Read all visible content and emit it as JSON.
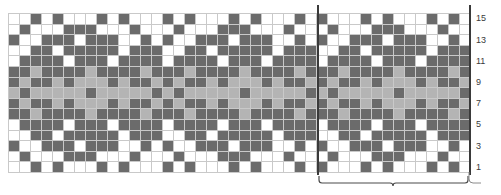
{
  "chart_data": {
    "type": "heatmap",
    "title": "",
    "xlabel": "",
    "ylabel": "",
    "rows": 15,
    "columns": 42,
    "palette": {
      "0": "#ffffff",
      "1": "#b4b4b4",
      "2": "#6b6b6b"
    },
    "color_names": {
      "0": "white",
      "1": "light-grey",
      "2": "dark-grey"
    },
    "row_numbers_visible": [
      15,
      13,
      11,
      9,
      7,
      5,
      3,
      1
    ],
    "row_number_side": "right",
    "repeat": {
      "label": "",
      "start_column": 29,
      "end_column": 42,
      "stitches": 14
    },
    "grid": [
      [
        0,
        0,
        2,
        0,
        2,
        0,
        0,
        0,
        2,
        0,
        2,
        0,
        0,
        0,
        2,
        0,
        2,
        0,
        0,
        0,
        2,
        0,
        2,
        0,
        0,
        0,
        2,
        0,
        2,
        0,
        0,
        0,
        2,
        0,
        2,
        0,
        0,
        0,
        2,
        0,
        2,
        0
      ],
      [
        0,
        2,
        0,
        0,
        0,
        2,
        2,
        2,
        0,
        0,
        0,
        2,
        0,
        0,
        0,
        2,
        0,
        0,
        0,
        2,
        2,
        2,
        0,
        0,
        0,
        2,
        0,
        0,
        0,
        2,
        0,
        0,
        0,
        2,
        2,
        2,
        0,
        0,
        0,
        2,
        0,
        0
      ],
      [
        2,
        0,
        0,
        2,
        2,
        2,
        0,
        2,
        2,
        2,
        0,
        0,
        2,
        0,
        2,
        0,
        0,
        2,
        2,
        2,
        0,
        2,
        2,
        2,
        0,
        0,
        2,
        0,
        2,
        0,
        0,
        2,
        2,
        2,
        0,
        2,
        2,
        2,
        0,
        0,
        2,
        0
      ],
      [
        0,
        0,
        2,
        2,
        0,
        2,
        2,
        2,
        2,
        2,
        0,
        2,
        2,
        2,
        0,
        0,
        2,
        2,
        0,
        2,
        2,
        2,
        2,
        2,
        0,
        2,
        2,
        2,
        0,
        0,
        2,
        2,
        0,
        2,
        2,
        2,
        2,
        2,
        0,
        2,
        2,
        2
      ],
      [
        0,
        2,
        2,
        2,
        2,
        0,
        2,
        2,
        2,
        0,
        2,
        2,
        2,
        2,
        0,
        2,
        2,
        2,
        2,
        0,
        2,
        2,
        2,
        0,
        2,
        2,
        2,
        2,
        0,
        2,
        2,
        2,
        2,
        0,
        2,
        2,
        2,
        0,
        2,
        2,
        2,
        2
      ],
      [
        2,
        2,
        1,
        2,
        2,
        2,
        2,
        1,
        2,
        2,
        2,
        2,
        1,
        2,
        2,
        2,
        1,
        2,
        2,
        2,
        2,
        1,
        2,
        2,
        2,
        2,
        1,
        2,
        2,
        2,
        1,
        2,
        2,
        2,
        2,
        1,
        2,
        2,
        2,
        2,
        1,
        2
      ],
      [
        2,
        1,
        2,
        2,
        1,
        2,
        1,
        1,
        1,
        2,
        1,
        2,
        2,
        1,
        2,
        1,
        2,
        2,
        1,
        2,
        1,
        1,
        1,
        2,
        1,
        2,
        2,
        1,
        2,
        1,
        2,
        2,
        1,
        2,
        1,
        1,
        1,
        2,
        1,
        2,
        2,
        1
      ],
      [
        1,
        2,
        1,
        1,
        1,
        1,
        1,
        2,
        1,
        1,
        1,
        1,
        1,
        2,
        1,
        2,
        1,
        1,
        1,
        1,
        1,
        2,
        1,
        1,
        1,
        1,
        1,
        2,
        1,
        2,
        1,
        1,
        1,
        1,
        1,
        2,
        1,
        1,
        1,
        1,
        1,
        2
      ],
      [
        2,
        1,
        2,
        2,
        1,
        2,
        1,
        1,
        1,
        2,
        1,
        2,
        2,
        1,
        2,
        1,
        2,
        2,
        1,
        2,
        1,
        1,
        1,
        2,
        1,
        2,
        2,
        1,
        2,
        1,
        2,
        2,
        1,
        2,
        1,
        1,
        1,
        2,
        1,
        2,
        2,
        1
      ],
      [
        2,
        2,
        1,
        2,
        2,
        2,
        2,
        1,
        2,
        2,
        2,
        2,
        1,
        2,
        2,
        2,
        1,
        2,
        2,
        2,
        2,
        1,
        2,
        2,
        2,
        2,
        1,
        2,
        2,
        2,
        1,
        2,
        2,
        2,
        2,
        1,
        2,
        2,
        2,
        2,
        1,
        2
      ],
      [
        0,
        2,
        2,
        2,
        2,
        0,
        2,
        2,
        2,
        0,
        2,
        2,
        2,
        2,
        0,
        2,
        2,
        2,
        2,
        0,
        2,
        2,
        2,
        0,
        2,
        2,
        2,
        2,
        0,
        2,
        2,
        2,
        2,
        0,
        2,
        2,
        2,
        0,
        2,
        2,
        2,
        2
      ],
      [
        0,
        0,
        2,
        2,
        0,
        2,
        2,
        2,
        2,
        2,
        0,
        2,
        2,
        2,
        0,
        0,
        2,
        2,
        0,
        2,
        2,
        2,
        2,
        2,
        0,
        2,
        2,
        2,
        0,
        0,
        2,
        2,
        0,
        2,
        2,
        2,
        2,
        2,
        0,
        2,
        2,
        2
      ],
      [
        2,
        0,
        0,
        2,
        2,
        2,
        0,
        2,
        2,
        2,
        0,
        0,
        2,
        0,
        2,
        0,
        0,
        2,
        2,
        2,
        0,
        2,
        2,
        2,
        0,
        0,
        2,
        0,
        2,
        0,
        0,
        2,
        2,
        2,
        0,
        2,
        2,
        2,
        0,
        0,
        2,
        0
      ],
      [
        0,
        2,
        0,
        0,
        0,
        2,
        2,
        2,
        0,
        0,
        0,
        2,
        0,
        0,
        0,
        2,
        0,
        0,
        0,
        2,
        2,
        2,
        0,
        0,
        0,
        2,
        0,
        0,
        0,
        2,
        0,
        0,
        0,
        2,
        2,
        2,
        0,
        0,
        0,
        2,
        0,
        0
      ],
      [
        0,
        0,
        2,
        0,
        2,
        0,
        0,
        0,
        2,
        0,
        2,
        0,
        0,
        0,
        2,
        0,
        2,
        0,
        0,
        0,
        2,
        0,
        2,
        0,
        0,
        0,
        2,
        0,
        2,
        0,
        0,
        0,
        2,
        0,
        2,
        0,
        0,
        0,
        2,
        0,
        2,
        0
      ]
    ]
  }
}
